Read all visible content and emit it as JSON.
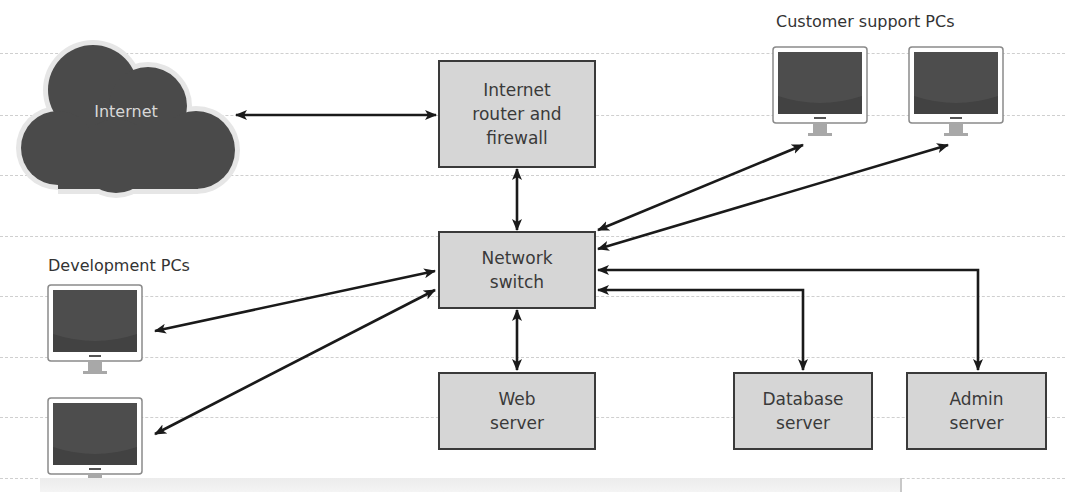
{
  "diagram": {
    "nodes": {
      "internet": {
        "label": "Internet"
      },
      "router": {
        "label": "Internet\nrouter and\nfirewall"
      },
      "switch": {
        "label": "Network\nswitch"
      },
      "web_server": {
        "label": "Web\nserver"
      },
      "database_server": {
        "label": "Database\nserver"
      },
      "admin_server": {
        "label": "Admin\nserver"
      }
    },
    "groups": {
      "customer_support": {
        "label": "Customer support PCs",
        "count": 2
      },
      "development": {
        "label": "Development PCs",
        "count": 2
      }
    },
    "connections": [
      {
        "from": "Internet",
        "to": "Internet router and firewall",
        "type": "bidirectional"
      },
      {
        "from": "Internet router and firewall",
        "to": "Network switch",
        "type": "bidirectional"
      },
      {
        "from": "Network switch",
        "to": "Customer support PC 1",
        "type": "bidirectional"
      },
      {
        "from": "Network switch",
        "to": "Customer support PC 2",
        "type": "bidirectional"
      },
      {
        "from": "Network switch",
        "to": "Development PC 1",
        "type": "bidirectional"
      },
      {
        "from": "Network switch",
        "to": "Development PC 2",
        "type": "bidirectional"
      },
      {
        "from": "Network switch",
        "to": "Web server",
        "type": "bidirectional"
      },
      {
        "from": "Network switch",
        "to": "Database server",
        "type": "bidirectional"
      },
      {
        "from": "Network switch",
        "to": "Admin server",
        "type": "bidirectional"
      }
    ],
    "colors": {
      "node_fill": "#d6d6d6",
      "node_border": "#3a3a3a",
      "cloud_fill": "#4a4a4a",
      "cloud_halo": "#e6e6e6",
      "screen": "#4d4d4d",
      "stand": "#a8a8a8",
      "arrow": "#1a1a1a",
      "guide": "#cfcfcf"
    }
  }
}
